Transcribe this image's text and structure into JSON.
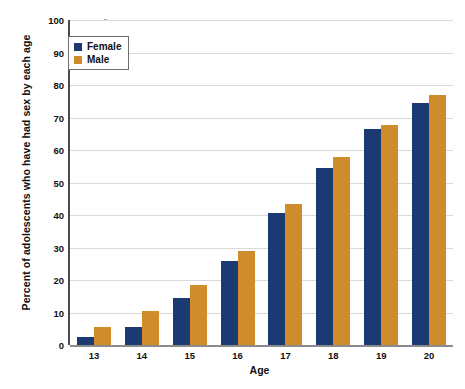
{
  "chart_data": {
    "type": "bar",
    "title": "",
    "xlabel": "Age",
    "ylabel": "Percent of adolescents who have had sex by each age",
    "categories": [
      "13",
      "14",
      "15",
      "16",
      "17",
      "18",
      "19",
      "20"
    ],
    "series": [
      {
        "name": "Female",
        "color": "#1b3a72",
        "values": [
          2.5,
          5.5,
          14.5,
          26,
          40.5,
          54.5,
          66.5,
          74.5
        ]
      },
      {
        "name": "Male",
        "color": "#d08b2c",
        "values": [
          5.5,
          10.5,
          18.5,
          29,
          43.5,
          58,
          67.8,
          77
        ]
      }
    ],
    "ylim": [
      0,
      100
    ],
    "ytick_labels": [
      "100",
      "90",
      "80",
      "70",
      "60",
      "50",
      "40",
      "30",
      "20",
      "10",
      "0"
    ],
    "ytick_values": [
      100,
      90,
      80,
      70,
      60,
      50,
      40,
      30,
      20,
      10,
      0
    ],
    "grid": true,
    "legend_position": "upper left",
    "background_color": "#ffffff",
    "gridline_color": "#d9d9d9",
    "axis_color": "#4a4a4a"
  },
  "legend": {
    "entries": [
      {
        "label": "Female"
      },
      {
        "label": "Male"
      }
    ]
  }
}
